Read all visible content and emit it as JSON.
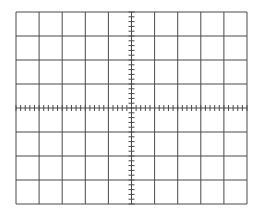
{
  "graticule": {
    "type": "oscilloscope-graticule",
    "divisions_x": 10,
    "divisions_y": 8,
    "minor_ticks_per_division": 5,
    "bounds": {
      "left": 16,
      "top": 12,
      "right": 247,
      "bottom": 204
    },
    "colors": {
      "grid": "#4a4a4a",
      "background": "#ffffff"
    }
  }
}
